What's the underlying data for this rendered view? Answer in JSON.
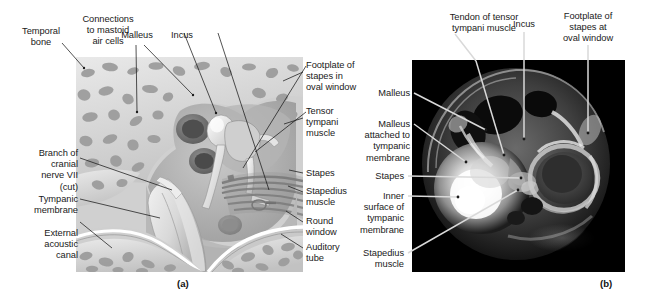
{
  "figure": {
    "panels": [
      {
        "id": "a",
        "caption": "(a)",
        "type": "illustration"
      },
      {
        "id": "b",
        "caption": "(b)",
        "type": "photograph"
      }
    ]
  },
  "panel_a": {
    "caption": "(a)",
    "labels_top": [
      {
        "name": "temporal-bone",
        "text": "Temporal\nbone"
      },
      {
        "name": "connections-to-mastoid-air-cells",
        "text": "Connections\nto mastoid\nair cells"
      },
      {
        "name": "malleus",
        "text": "Malleus"
      },
      {
        "name": "incus",
        "text": "Incus"
      }
    ],
    "labels_left": [
      {
        "name": "branch-of-cranial-nerve-vii",
        "text": "Branch of\ncranial\nnerve VII\n(cut)"
      },
      {
        "name": "tympanic-membrane",
        "text": "Tympanic\nmembrane"
      },
      {
        "name": "external-acoustic-canal",
        "text": "External\nacoustic\ncanal"
      }
    ],
    "labels_right": [
      {
        "name": "footplate-of-stapes-in-oval-window",
        "text": "Footplate of\nstapes in\noval window"
      },
      {
        "name": "tensor-tympani-muscle",
        "text": "Tensor\ntympani\nmuscle"
      },
      {
        "name": "stapes",
        "text": "Stapes"
      },
      {
        "name": "stapedius-muscle",
        "text": "Stapedius\nmuscle"
      },
      {
        "name": "round-window",
        "text": "Round\nwindow"
      },
      {
        "name": "auditory-tube",
        "text": "Auditory\ntube"
      }
    ]
  },
  "panel_b": {
    "caption": "(b)",
    "labels_top": [
      {
        "name": "tendon-of-tensor-tympani-muscle",
        "text": "Tendon of tensor\ntympani muscle"
      },
      {
        "name": "incus",
        "text": "Incus"
      },
      {
        "name": "footplate-of-stapes-at-oval-window",
        "text": "Footplate of\nstapes at\noval window"
      }
    ],
    "labels_left": [
      {
        "name": "malleus",
        "text": "Malleus"
      },
      {
        "name": "malleus-attached-to-tympanic-membrane",
        "text": "Malleus\nattached to\ntympanic\nmembrane"
      },
      {
        "name": "stapes",
        "text": "Stapes"
      },
      {
        "name": "inner-surface-of-tympanic-membrane",
        "text": "Inner\nsurface of\ntympanic\nmembrane"
      },
      {
        "name": "stapedius-muscle",
        "text": "Stapedius\nmuscle"
      }
    ]
  },
  "colors": {
    "text": "#1a1a1a",
    "leader_dark": "#1a1a1a",
    "leader_light": "#d9d9d9",
    "photo_background": "#000000",
    "illustration_background": "#cfcfcf"
  }
}
